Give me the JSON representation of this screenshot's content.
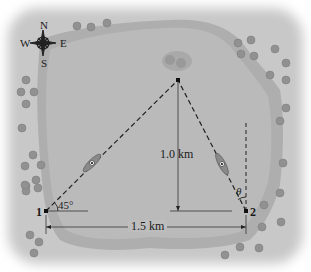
{
  "compass": {
    "north": "N",
    "south": "S",
    "east": "E",
    "west": "W"
  },
  "points": {
    "p1": "1",
    "p2": "2"
  },
  "distances": {
    "vertical": "1.0 km",
    "horizontal": "1.5 km"
  },
  "angles": {
    "at_point_1": "45°",
    "at_point_2": "θ"
  },
  "colors": {
    "land": "#c9c9c9",
    "lake": "#b3b3b3",
    "shore": "#a6a6a6",
    "lines": "#222222",
    "rocks": "#8f8f8f"
  }
}
